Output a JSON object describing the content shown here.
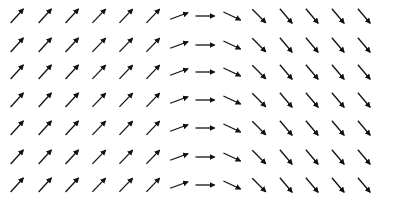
{
  "chart_data": {
    "type": "quiver",
    "title": "",
    "xlabel": "",
    "ylabel": "",
    "grid": false,
    "legend": null,
    "columns": 14,
    "rows": 7,
    "x_centers_px": [
      17,
      45,
      72,
      99,
      126,
      153,
      179,
      205,
      232,
      259,
      286,
      312,
      338,
      364
    ],
    "y_centers_px": [
      16,
      45,
      72,
      100,
      128,
      157,
      185
    ],
    "arrow_length_px": 19,
    "arrow_color": "#111111",
    "column_angles_deg": [
      48,
      48,
      47,
      46,
      46,
      46,
      20,
      0,
      -25,
      -45,
      -50,
      -50,
      -50,
      -50
    ],
    "note": "Every row has identical arrow directions per column; angle measured counter-clockwise from +x."
  }
}
